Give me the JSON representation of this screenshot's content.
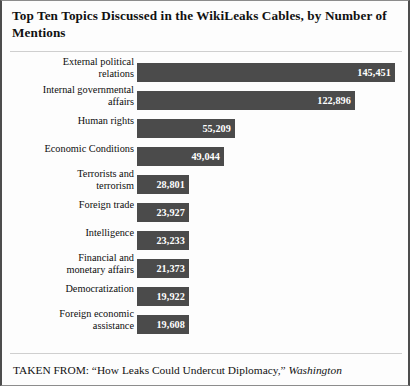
{
  "chart_data": {
    "type": "bar",
    "orientation": "horizontal",
    "title": "Top Ten Topics Discussed in the WikiLeaks Cables, by Number of Mentions",
    "xlabel": "",
    "ylabel": "",
    "grid": false,
    "legend": false,
    "xlim": [
      0,
      145451
    ],
    "categories": [
      "External political relations",
      "Internal governmental affairs",
      "Human rights",
      "Economic Conditions",
      "Terrorists and terrorism",
      "Foreign trade",
      "Intelligence",
      "Financial and monetary affairs",
      "Democratization",
      "Foreign economic assistance"
    ],
    "values": [
      145451,
      122896,
      55209,
      49044,
      28801,
      23927,
      23233,
      21373,
      19922,
      19608
    ],
    "value_labels": [
      "145,451",
      "122,896",
      "55,209",
      "49,044",
      "28,801",
      "23,927",
      "23,233",
      "21,373",
      "19,922",
      "19,608"
    ],
    "bars": [
      {
        "label_line1": "External political",
        "label_line2": "relations",
        "value": 145451,
        "value_label": "145,451"
      },
      {
        "label_line1": "Internal governmental",
        "label_line2": "affairs",
        "value": 122896,
        "value_label": "122,896"
      },
      {
        "label_line1": "Human rights",
        "label_line2": "",
        "value": 55209,
        "value_label": "55,209"
      },
      {
        "label_line1": "Economic Conditions",
        "label_line2": "",
        "value": 49044,
        "value_label": "49,044"
      },
      {
        "label_line1": "Terrorists and",
        "label_line2": "terrorism",
        "value": 28801,
        "value_label": "28,801"
      },
      {
        "label_line1": "Foreign trade",
        "label_line2": "",
        "value": 23927,
        "value_label": "23,927"
      },
      {
        "label_line1": "Intelligence",
        "label_line2": "",
        "value": 23233,
        "value_label": "23,233"
      },
      {
        "label_line1": "Financial and",
        "label_line2": "monetary affairs",
        "value": 21373,
        "value_label": "21,373"
      },
      {
        "label_line1": "Democratization",
        "label_line2": "",
        "value": 19922,
        "value_label": "19,922"
      },
      {
        "label_line1": "Foreign economic",
        "label_line2": "assistance",
        "value": 19608,
        "value_label": "19,608"
      }
    ],
    "colors": {
      "bar_fill": "#4b4b4b",
      "value_text": "#ffffff",
      "background": "#fdfdfd",
      "label_text": "#0d0d0d",
      "border": "#4d4d4d"
    }
  },
  "footer": {
    "prefix": "TAKEN FROM: “How Leaks Could Undercut Diplomacy,” ",
    "publication": "Washington"
  }
}
